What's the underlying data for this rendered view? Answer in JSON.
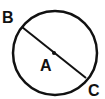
{
  "diagram": {
    "type": "circle-with-diameter",
    "circle": {
      "center": [
        55,
        53
      ],
      "radius": 42,
      "stroke_color": "#111111",
      "stroke_width": 2.5
    },
    "diameter": {
      "from": "B",
      "to": "C",
      "start": [
        22,
        27
      ],
      "end": [
        86,
        78
      ],
      "stroke_color": "#111111"
    },
    "center_point": {
      "position": [
        54,
        53
      ],
      "color": "#111111"
    },
    "labels": {
      "B": {
        "text": "B",
        "x": 2,
        "y": 23
      },
      "A": {
        "text": "A",
        "x": 40,
        "y": 71
      },
      "C": {
        "text": "C",
        "x": 88,
        "y": 96
      }
    }
  }
}
